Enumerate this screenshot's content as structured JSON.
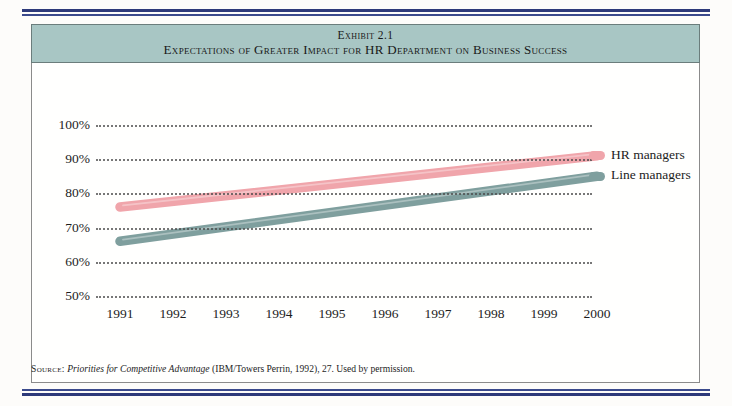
{
  "exhibit": {
    "number_label": "Exhibit 2.1",
    "subtitle": "Expectations of Greater Impact for HR Department on Business Success"
  },
  "source": {
    "label": "Source:",
    "title": "Priorities for Competitive Advantage",
    "rest": "(IBM/Towers Perrin, 1992), 27. Used by permission."
  },
  "colors": {
    "band": "#a8c6c4",
    "rule": "#2e3a7a",
    "hr_managers": "#f0a5ab",
    "line_managers": "#7f9f9e",
    "gridline": "#4a4a4a",
    "text": "#1d1d1d"
  },
  "chart_data": {
    "type": "line",
    "title": "Expectations of Greater Impact for HR Department on Business Success",
    "xlabel": "",
    "ylabel": "",
    "categories": [
      "1991",
      "1992",
      "1993",
      "1994",
      "1995",
      "1996",
      "1997",
      "1998",
      "1999",
      "2000"
    ],
    "x": [
      1991,
      1992,
      1993,
      1994,
      1995,
      1996,
      1997,
      1998,
      1999,
      2000
    ],
    "ylim": [
      50,
      100
    ],
    "yticks": [
      50,
      60,
      70,
      80,
      90,
      100
    ],
    "ytick_labels": [
      "50%",
      "60%",
      "70%",
      "80%",
      "90%",
      "100%"
    ],
    "grid": "horizontal-dotted",
    "legend_position": "right-of-line-ends",
    "series": [
      {
        "name": "HR managers",
        "color": "#f0a5ab",
        "values": [
          76,
          77.7,
          79.3,
          81,
          82.7,
          84.3,
          86,
          87.7,
          89.3,
          91
        ]
      },
      {
        "name": "Line managers",
        "color": "#7f9f9e",
        "values": [
          66,
          68.1,
          70.2,
          72.3,
          74.4,
          76.6,
          78.7,
          80.8,
          82.9,
          85
        ]
      }
    ]
  }
}
